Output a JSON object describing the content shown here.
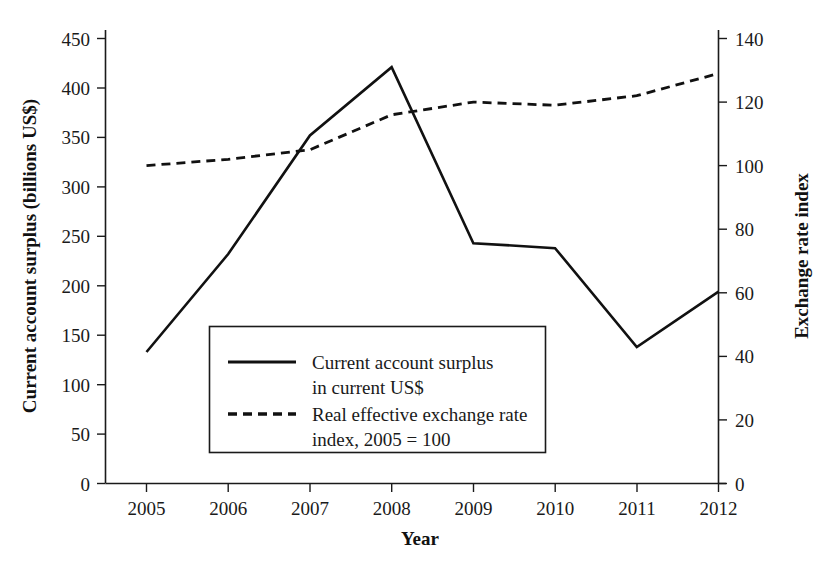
{
  "chart_data": {
    "type": "line",
    "title": "",
    "xlabel": "Year",
    "ylabel": "Current account surplus (billions US$)",
    "y2label": "Exchange rate index",
    "x": [
      2005,
      2006,
      2007,
      2008,
      2009,
      2010,
      2011,
      2012
    ],
    "xtick_labels": [
      "2005",
      "2006",
      "2007",
      "2008",
      "2009",
      "2010",
      "2011",
      "2012"
    ],
    "xlim": [
      2005,
      2012
    ],
    "ylim": [
      0,
      450
    ],
    "ytick_labels": [
      "0",
      "50",
      "100",
      "150",
      "200",
      "250",
      "300",
      "350",
      "400",
      "450"
    ],
    "ytick_values": [
      0,
      50,
      100,
      150,
      200,
      250,
      300,
      350,
      400,
      450
    ],
    "y2lim": [
      0,
      140
    ],
    "y2tick_labels": [
      "0",
      "20",
      "40",
      "60",
      "80",
      "100",
      "120",
      "140"
    ],
    "y2tick_values": [
      0,
      20,
      40,
      60,
      80,
      100,
      120,
      140
    ],
    "grid": false,
    "legend_position": "center-left-inside",
    "series": [
      {
        "name": "Current account surplus in current US$",
        "axis": "left",
        "style": "solid",
        "color": "#111111",
        "values": [
          133,
          232,
          352,
          421,
          243,
          238,
          138,
          194
        ]
      },
      {
        "name": "Real effective exchange rate index, 2005 = 100",
        "axis": "right",
        "style": "dashed",
        "color": "#111111",
        "values": [
          100,
          102,
          105,
          116,
          120,
          119,
          122,
          129
        ]
      }
    ]
  },
  "legend": {
    "entries": [
      {
        "line1": "Current account surplus",
        "line2": "in current US$",
        "style": "solid",
        "swatch": "solid-line-swatch"
      },
      {
        "line1": "Real effective exchange rate",
        "line2": "index, 2005 = 100",
        "style": "dashed",
        "swatch": "dashed-line-swatch"
      }
    ]
  },
  "axes": {
    "y_left_title": "Current account surplus (billions US$)",
    "y_right_title": "Exchange rate index",
    "x_title": "Year"
  }
}
